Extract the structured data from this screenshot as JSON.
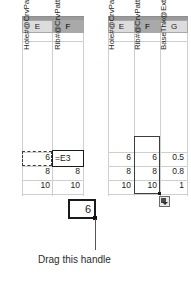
{
  "left_table": {
    "name": "design-table-before",
    "column_headers": [
      {
        "letter": "E",
        "selected": false
      },
      {
        "letter": "F",
        "selected": true
      }
    ],
    "parameter_headers": [
      "Hole#@CrvPattern1",
      "Rib#@CrvPattern2"
    ],
    "rows": [
      [
        "6",
        "=E3"
      ],
      [
        "8",
        "8"
      ],
      [
        "10",
        "10"
      ]
    ]
  },
  "right_table": {
    "name": "design-table-after",
    "column_headers": [
      {
        "letter": "E",
        "selected": false
      },
      {
        "letter": "F",
        "selected": true
      },
      {
        "letter": "G",
        "selected": false
      }
    ],
    "parameter_headers": [
      "Hole#@CrvPattern1",
      "Rib#@CrvPattern2",
      "BaseThk@Extrude1"
    ],
    "rows": [
      [
        "6",
        "6",
        "0.5"
      ],
      [
        "8",
        "8",
        "0.8"
      ],
      [
        "10",
        "10",
        "1"
      ]
    ],
    "autofill_tag": "autofill-options-icon"
  },
  "callout": {
    "cell_value": "6",
    "caption": "Drag this handle"
  },
  "colors": {
    "header_fill": "#dcdcdc",
    "header_selected_fill": "#a9a9a9",
    "gridline": "#cfcfcf",
    "border": "#a8a8a8",
    "text": "#1a1a1a"
  }
}
